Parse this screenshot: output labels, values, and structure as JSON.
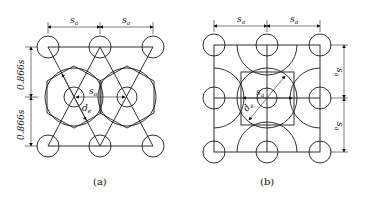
{
  "figure": {
    "panel_a": {
      "caption": "(a)",
      "pattern": "triangular",
      "labels": {
        "top_spacing_left": "s",
        "top_spacing_right": "s",
        "spacing_sub": "a",
        "center_spacing": "s",
        "diameter": "d",
        "diameter_sub": "e",
        "vertical_upper": "0.866s",
        "vertical_lower": "0.866s"
      }
    },
    "panel_b": {
      "caption": "(b)",
      "pattern": "square",
      "labels": {
        "top_spacing_left": "s",
        "top_spacing_right": "s",
        "spacing_sub": "a",
        "center_spacing": "s",
        "diameter": "d",
        "diameter_sub": "e",
        "vertical_upper": "s",
        "vertical_lower": "s"
      }
    }
  }
}
